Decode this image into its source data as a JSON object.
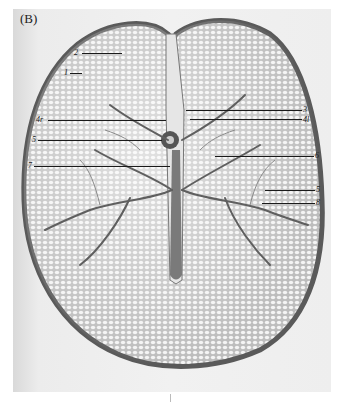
{
  "figure": {
    "panel_label": "(B)",
    "colors": {
      "background": "#f0f0f0",
      "outline": "#4a4a4a",
      "tissue": "#cfcfcf",
      "veins": "#5a5a5a"
    },
    "labels_left": [
      {
        "text": "2"
      },
      {
        "text": "1"
      },
      {
        "text": "4r"
      },
      {
        "text": "5"
      },
      {
        "text": "7"
      }
    ],
    "labels_right": [
      {
        "text": "3"
      },
      {
        "text": "4l"
      },
      {
        "text": "6"
      },
      {
        "text": "5"
      },
      {
        "text": "8"
      }
    ]
  }
}
